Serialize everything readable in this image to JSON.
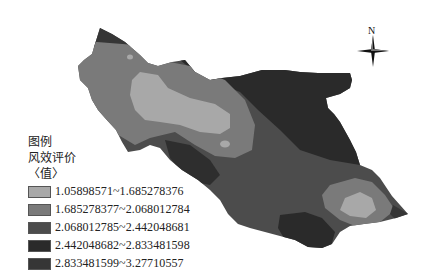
{
  "map": {
    "title": "",
    "north_arrow": {
      "label": "N"
    },
    "colors": {
      "class1": "#a8a8a8",
      "class2": "#7a7a7a",
      "class3": "#4c4c4c",
      "class4": "#2a2a2a",
      "class5": "#363636"
    }
  },
  "legend": {
    "title": "图例",
    "field": "风效评价",
    "unit": "〈值〉",
    "items": [
      {
        "label": "1.05898571~1.685278376",
        "color": "#a8a8a8"
      },
      {
        "label": "1.685278377~2.068012784",
        "color": "#7a7a7a"
      },
      {
        "label": "2.068012785~2.442048681",
        "color": "#4c4c4c"
      },
      {
        "label": "2.442048682~2.833481598",
        "color": "#2a2a2a"
      },
      {
        "label": "2.833481599~3.27710557",
        "color": "#363636"
      }
    ]
  }
}
